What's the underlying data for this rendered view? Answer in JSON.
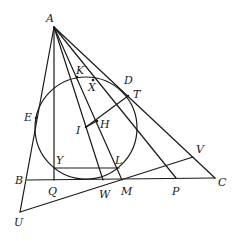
{
  "diagram": {
    "type": "geometry",
    "stroke_color": "#1a1a1a",
    "background": "#ffffff",
    "points": {
      "A": {
        "label": "A",
        "x": 54,
        "y": 27,
        "lx": 46,
        "ly": 22
      },
      "B": {
        "label": "B",
        "x": 27,
        "y": 180,
        "lx": 15,
        "ly": 184
      },
      "C": {
        "label": "C",
        "x": 215,
        "y": 178,
        "lx": 218,
        "ly": 186
      },
      "D": {
        "label": "D",
        "x": 122,
        "y": 89,
        "lx": 124,
        "ly": 84
      },
      "T": {
        "label": "T",
        "x": 128,
        "y": 96,
        "lx": 133,
        "ly": 98
      },
      "K": {
        "label": "K",
        "x": 77,
        "y": 77,
        "lx": 76,
        "ly": 74
      },
      "X": {
        "label": "X",
        "x": 93,
        "y": 80,
        "lx": 88,
        "ly": 91
      },
      "E": {
        "label": "E",
        "x": 36,
        "y": 118,
        "lx": 24,
        "ly": 121
      },
      "H": {
        "label": "H",
        "x": 97,
        "y": 121,
        "lx": 100,
        "ly": 128
      },
      "I": {
        "label": "I",
        "x": 86,
        "y": 127,
        "lx": 76,
        "ly": 134
      },
      "Y": {
        "label": "Y",
        "x": 54,
        "y": 168,
        "lx": 56,
        "ly": 164
      },
      "L": {
        "label": "L",
        "x": 119,
        "y": 168,
        "lx": 115,
        "ly": 164
      },
      "Q": {
        "label": "Q",
        "x": 54,
        "y": 180,
        "lx": 48,
        "ly": 195
      },
      "W": {
        "label": "W",
        "x": 103,
        "y": 180,
        "lx": 99,
        "ly": 198
      },
      "M": {
        "label": "M",
        "x": 122,
        "y": 180,
        "lx": 121,
        "ly": 195
      },
      "P": {
        "label": "P",
        "x": 176,
        "y": 178,
        "lx": 172,
        "ly": 195
      },
      "V": {
        "label": "V",
        "x": 193,
        "y": 157,
        "lx": 196,
        "ly": 153
      },
      "U": {
        "label": "U",
        "x": 20,
        "y": 212,
        "lx": 14,
        "ly": 226
      }
    },
    "circle": {
      "name": "incircle",
      "cx": 86,
      "cy": 128,
      "r": 51
    },
    "segments": [
      {
        "name": "A-U",
        "from": "A",
        "to": "U"
      },
      {
        "name": "A-Q",
        "from": "A",
        "to": "Q"
      },
      {
        "name": "A-W",
        "from": "A",
        "to": "W"
      },
      {
        "name": "A-M",
        "from": "A",
        "to": "M"
      },
      {
        "name": "A-P",
        "from": "A",
        "to": "P"
      },
      {
        "name": "A-C",
        "from": "A",
        "to": "C"
      },
      {
        "name": "B-C",
        "from": "B",
        "to": "C"
      },
      {
        "name": "U-V",
        "from": "U",
        "to": "V"
      },
      {
        "name": "Y-L",
        "from": "Y",
        "to": "L"
      },
      {
        "name": "I-T",
        "from": "I",
        "to": "T"
      },
      {
        "name": "I-H",
        "from": "I",
        "to": "H"
      }
    ]
  }
}
